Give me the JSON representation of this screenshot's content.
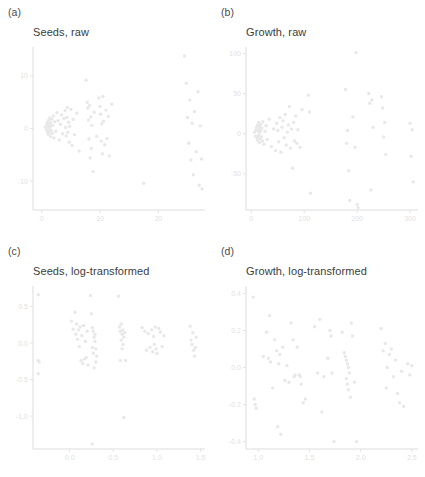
{
  "figure": {
    "background": "#ffffff",
    "point_color": "#e8e8e8",
    "axis_color": "#d9d9d9",
    "tick_label_color": "#e2e2e2",
    "title_color": "#3c3c3c"
  },
  "panels": [
    {
      "tag": "(a)",
      "title": "Seeds, raw",
      "position": "top-left"
    },
    {
      "tag": "(b)",
      "title": "Growth, raw",
      "position": "top-right"
    },
    {
      "tag": "(c)",
      "title": "Seeds, log-transformed",
      "position": "bottom-left"
    },
    {
      "tag": "(d)",
      "title": "Growth, log-transformed",
      "position": "bottom-right"
    }
  ],
  "chart_data": [
    {
      "type": "scatter",
      "title": "Seeds, raw",
      "panel_tag": "(a)",
      "xlabel": "",
      "ylabel": "",
      "xlim": [
        -1.5,
        28
      ],
      "ylim": [
        -15.5,
        15.5
      ],
      "xticks": [
        0,
        10,
        20
      ],
      "xticklabels": [
        "0",
        "10",
        "20"
      ],
      "yticks": [
        10,
        0,
        -10
      ],
      "yticklabels": [
        "10",
        "0",
        "-10"
      ],
      "grid": false,
      "legend": "none",
      "x": [
        0.6,
        0.8,
        0.9,
        1.0,
        1.0,
        1.1,
        1.1,
        1.2,
        1.2,
        1.3,
        1.3,
        1.4,
        1.4,
        1.5,
        1.5,
        1.6,
        1.6,
        1.7,
        1.8,
        1.9,
        2.0,
        2.1,
        2.2,
        2.4,
        2.6,
        2.8,
        3.0,
        3.2,
        3.4,
        3.6,
        3.8,
        4.0,
        4.1,
        4.2,
        4.3,
        4.4,
        4.5,
        4.6,
        4.7,
        4.8,
        5.0,
        5.2,
        5.4,
        5.6,
        6.0,
        6.4,
        7.6,
        7.8,
        7.9,
        8.0,
        8.1,
        8.2,
        8.3,
        8.4,
        8.5,
        8.6,
        8.8,
        9.0,
        9.4,
        9.8,
        10.0,
        10.1,
        10.2,
        10.3,
        10.4,
        10.5,
        10.6,
        10.8,
        11.0,
        11.2,
        11.4,
        11.6,
        12.0,
        17.5,
        24.5,
        24.8,
        25.0,
        25.2,
        25.4,
        25.6,
        25.8,
        26.0,
        26.2,
        26.5,
        26.8,
        27.0,
        27.2,
        27.4,
        27.5
      ],
      "y": [
        0.3,
        -0.2,
        0.8,
        1.2,
        -0.6,
        0.4,
        -1.1,
        1.6,
        -0.3,
        0.9,
        -0.8,
        2.0,
        0.1,
        -1.5,
        1.1,
        0.5,
        -0.4,
        1.8,
        -0.9,
        0.6,
        2.4,
        -1.8,
        1.3,
        -0.5,
        3.0,
        1.5,
        -2.2,
        0.8,
        2.6,
        -1.0,
        1.9,
        3.4,
        0.2,
        -1.4,
        2.1,
        4.0,
        -0.7,
        1.2,
        -2.6,
        0.4,
        3.6,
        -3.2,
        1.7,
        -1.2,
        2.9,
        -4.3,
        9.2,
        5.0,
        3.9,
        1.6,
        -2.0,
        4.4,
        -5.6,
        2.2,
        -3.8,
        0.6,
        -8.2,
        3.1,
        -1.5,
        5.8,
        4.2,
        2.7,
        -2.4,
        0.9,
        -4.8,
        6.1,
        1.4,
        -3.1,
        3.5,
        -1.9,
        2.3,
        -5.2,
        4.6,
        -10.4,
        13.8,
        8.6,
        2.1,
        -2.8,
        5.4,
        -6.0,
        1.0,
        -8.8,
        3.2,
        -4.4,
        7.0,
        -10.8,
        0.5,
        -5.8,
        -11.5
      ],
      "notes": "Residual scatter with strong funnel-shaped heteroscedasticity; variance increases with x"
    },
    {
      "type": "scatter",
      "title": "Growth, raw",
      "panel_tag": "(b)",
      "xlabel": "",
      "ylabel": "",
      "xlim": [
        -10,
        315
      ],
      "ylim": [
        -95,
        108
      ],
      "xticks": [
        0,
        100,
        200,
        300
      ],
      "xticklabels": [
        "0",
        "100",
        "200",
        "300"
      ],
      "yticks": [
        100,
        50,
        0,
        -50
      ],
      "yticklabels": [
        "100",
        "50",
        "0",
        "-50"
      ],
      "grid": false,
      "legend": "none",
      "x": [
        6,
        8,
        9,
        10,
        11,
        12,
        12,
        13,
        14,
        14,
        15,
        15,
        16,
        16,
        17,
        18,
        18,
        19,
        20,
        21,
        22,
        24,
        26,
        28,
        30,
        34,
        38,
        42,
        46,
        48,
        50,
        52,
        54,
        56,
        58,
        60,
        62,
        64,
        66,
        68,
        70,
        72,
        74,
        76,
        78,
        80,
        82,
        84,
        86,
        88,
        92,
        96,
        108,
        110,
        112,
        178,
        180,
        182,
        184,
        186,
        192,
        196,
        198,
        200,
        202,
        222,
        224,
        226,
        228,
        230,
        246,
        248,
        250,
        252,
        254,
        300,
        302,
        304,
        306
      ],
      "y": [
        2,
        -3,
        5,
        8,
        -5,
        11,
        -8,
        3,
        14,
        -2,
        6,
        -11,
        1,
        9,
        -6,
        4,
        12,
        -4,
        7,
        -9,
        15,
        -13,
        3,
        10,
        -7,
        18,
        -16,
        6,
        -21,
        13,
        4,
        -10,
        20,
        -23,
        8,
        16,
        -5,
        24,
        -14,
        2,
        11,
        34,
        -18,
        6,
        -43,
        14,
        -9,
        22,
        -12,
        5,
        -17,
        30,
        48,
        27,
        -74,
        55,
        -12,
        4,
        -46,
        -83,
        21,
        -17,
        101,
        -88,
        -92,
        50,
        38,
        -70,
        42,
        8,
        46,
        32,
        -4,
        14,
        -26,
        13,
        -28,
        5,
        -60
      ],
      "notes": "Residual scatter, raw growth; spread widens substantially at higher fitted values"
    },
    {
      "type": "scatter",
      "title": "Seeds, log-transformed",
      "panel_tag": "(c)",
      "xlabel": "",
      "ylabel": "",
      "xlim": [
        -0.42,
        1.55
      ],
      "ylim": [
        -1.45,
        0.78
      ],
      "xticks": [
        0.0,
        0.5,
        1.0,
        1.5
      ],
      "xticklabels": [
        "0.0",
        "0.5",
        "1.0",
        "1.5"
      ],
      "yticks": [
        0.5,
        0.0,
        -0.5,
        -1.0
      ],
      "yticklabels": [
        "0.5",
        "0.0",
        "-0.5",
        "-1.0"
      ],
      "grid": false,
      "legend": "none",
      "x": [
        -0.36,
        -0.36,
        -0.36,
        -0.35,
        0.02,
        0.04,
        0.06,
        0.07,
        0.08,
        0.09,
        0.1,
        0.11,
        0.12,
        0.13,
        0.14,
        0.15,
        0.16,
        0.17,
        0.18,
        0.19,
        0.2,
        0.21,
        0.24,
        0.25,
        0.26,
        0.26,
        0.27,
        0.27,
        0.28,
        0.28,
        0.29,
        0.29,
        0.3,
        0.3,
        0.31,
        0.56,
        0.57,
        0.58,
        0.58,
        0.59,
        0.59,
        0.6,
        0.6,
        0.61,
        0.61,
        0.62,
        0.62,
        0.63,
        0.64,
        0.83,
        0.86,
        0.88,
        0.9,
        0.92,
        0.94,
        0.95,
        0.96,
        0.97,
        0.98,
        0.99,
        1.0,
        1.02,
        1.04,
        1.06,
        1.08,
        1.38,
        1.39,
        1.4,
        1.41,
        1.42,
        1.43,
        1.44,
        1.45
      ],
      "y": [
        0.66,
        -0.24,
        -0.42,
        -0.26,
        0.3,
        0.19,
        0.42,
        0.12,
        0.26,
        0.05,
        0.18,
        -0.05,
        0.22,
        -0.24,
        0.1,
        -0.28,
        0.24,
        -0.22,
        0.02,
        -0.2,
        0.16,
        -0.3,
        0.65,
        0.4,
        0.21,
        -0.06,
        0.16,
        -0.14,
        0.08,
        -0.34,
        0.02,
        0.12,
        -0.08,
        -0.26,
        -0.18,
        0.64,
        0.22,
        0.16,
        -0.24,
        0.26,
        0.04,
        0.12,
        -0.08,
        0.18,
        -0.02,
        0.08,
        -1.02,
        0.14,
        -0.24,
        0.21,
        0.16,
        -0.1,
        0.13,
        -0.06,
        0.18,
        -0.12,
        0.09,
        -0.02,
        0.22,
        -0.08,
        -0.14,
        0.2,
        0.15,
        -0.05,
        0.1,
        0.23,
        0.04,
        -0.02,
        0.14,
        -0.1,
        -0.18,
        -0.06,
        0.08
      ],
      "extra_low_points": [
        [
          0.26,
          -1.38
        ]
      ],
      "notes": "After log transform residual spread is roughly constant across x (homoscedastic)"
    },
    {
      "type": "scatter",
      "title": "Growth, log-transformed",
      "panel_tag": "(d)",
      "xlabel": "",
      "ylabel": "",
      "xlim": [
        0.88,
        2.56
      ],
      "ylim": [
        -0.44,
        0.44
      ],
      "xticks": [
        1.0,
        1.5,
        2.0,
        2.5
      ],
      "xticklabels": [
        "1.0",
        "1.5",
        "2.0",
        "2.5"
      ],
      "yticks": [
        0.4,
        0.2,
        0.0,
        -0.2,
        -0.4
      ],
      "yticklabels": [
        "0.4",
        "0.2",
        "0.0",
        "-0.2",
        "-0.4"
      ],
      "grid": false,
      "legend": "none",
      "x": [
        0.95,
        0.96,
        0.97,
        0.98,
        1.05,
        1.08,
        1.1,
        1.11,
        1.12,
        1.14,
        1.16,
        1.18,
        1.19,
        1.2,
        1.21,
        1.22,
        1.24,
        1.26,
        1.28,
        1.3,
        1.32,
        1.34,
        1.35,
        1.36,
        1.38,
        1.4,
        1.41,
        1.42,
        1.44,
        1.46,
        1.55,
        1.58,
        1.6,
        1.62,
        1.64,
        1.68,
        1.7,
        1.71,
        1.72,
        1.74,
        1.82,
        1.84,
        1.85,
        1.86,
        1.86,
        1.87,
        1.87,
        1.88,
        1.88,
        1.89,
        1.9,
        1.91,
        1.92,
        1.94,
        1.96,
        2.2,
        2.22,
        2.24,
        2.25,
        2.26,
        2.28,
        2.3,
        2.32,
        2.34,
        2.36,
        2.38,
        2.4,
        2.42,
        2.46,
        2.48,
        2.5
      ],
      "y": [
        0.38,
        -0.17,
        -0.2,
        -0.22,
        0.06,
        0.19,
        0.05,
        0.28,
        0.03,
        -0.11,
        0.15,
        0.09,
        -0.32,
        0.02,
        0.07,
        -0.36,
        0.11,
        -0.07,
        0.01,
        -0.08,
        0.24,
        0.15,
        -0.05,
        -0.04,
        0.11,
        -0.04,
        -0.05,
        -0.09,
        -0.19,
        -0.17,
        0.22,
        -0.03,
        0.26,
        -0.24,
        -0.05,
        0.05,
        0.2,
        0.17,
        -0.03,
        -0.4,
        0.19,
        0.08,
        0.06,
        0.04,
        -0.06,
        0.02,
        -0.09,
        0.0,
        -0.12,
        -0.03,
        -0.16,
        0.24,
        0.17,
        -0.08,
        -0.4,
        0.21,
        0.09,
        0.13,
        -0.11,
        0.0,
        0.07,
        0.1,
        -0.05,
        0.04,
        -0.14,
        -0.19,
        -0.02,
        -0.21,
        0.02,
        -0.04,
        0.01
      ],
      "notes": "After log transform residual spread is approximately uniform band around zero"
    }
  ]
}
